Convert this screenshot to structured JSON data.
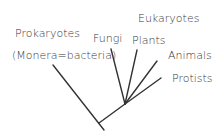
{
  "diagram": {
    "type": "phylogenetic-tree",
    "labels": {
      "prokaryotes": "Prokaryotes",
      "monera": "(Monera=bacteria)",
      "eukaryotes": "Eukaryotes",
      "fungi": "Fungi",
      "plants": "Plants",
      "animals": "Animals",
      "protists": "Protists"
    },
    "colors": {
      "line": "#333333",
      "text": "#3a3a3a",
      "background": "#ffffff"
    }
  }
}
